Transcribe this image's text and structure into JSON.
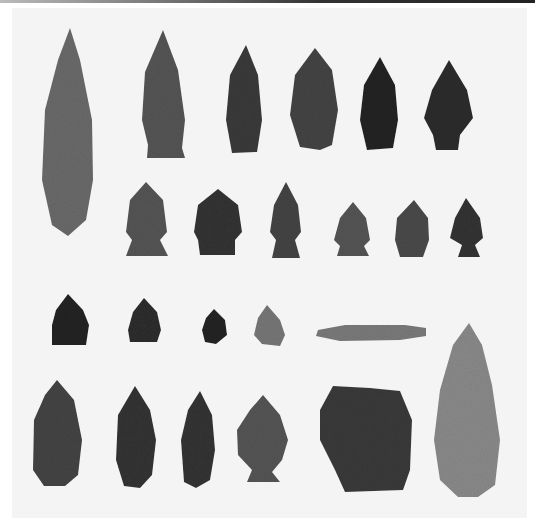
{
  "image": {
    "description": "Black-and-white photograph of a collection of chipped stone projectile points and tools arranged in four rows on a light background",
    "rows": [
      {
        "row": 1,
        "count": 6,
        "items": [
          "long lanceolate blade (spans rows 1-2)",
          "stemmed lanceolate point",
          "narrow leaf point",
          "ovate leaf point",
          "dark serrated point",
          "dark corner-notched point"
        ]
      },
      {
        "row": 2,
        "count": 6,
        "items": [
          "side-notched point",
          "corner-notched point",
          "side-notched point",
          "small side-notched point",
          "triangular point",
          "small notched point"
        ]
      },
      {
        "row": 3,
        "count": 5,
        "items": [
          "small dark triangular point",
          "small dark point",
          "tiny point",
          "small light notched point",
          "long narrow drill/blade"
        ]
      },
      {
        "row": 4,
        "count": 6,
        "items": [
          "ovate biface",
          "leaf-shaped biface",
          "narrow leaf point",
          "corner-notched point",
          "large squared scraper",
          "large light lanceolate point"
        ]
      }
    ],
    "total_artifacts": 23,
    "colors": {
      "background": "#f4f4f4",
      "stone_dark": "#2a2a2a",
      "stone_mid": "#555555",
      "stone_light": "#8a8a8a"
    }
  }
}
